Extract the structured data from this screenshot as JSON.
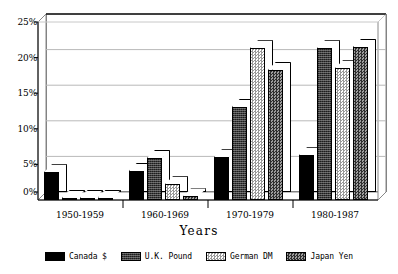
{
  "chart_data": {
    "type": "bar",
    "title": "",
    "xlabel": "Years",
    "ylabel": "",
    "categories": [
      "1950-1959",
      "1960-1969",
      "1970-1979",
      "1980-1987"
    ],
    "ylim": [
      0,
      25
    ],
    "ytick_values": [
      0,
      5,
      10,
      15,
      20,
      25
    ],
    "ytick_labels": [
      "0%",
      "5%",
      "10%",
      "15%",
      "20%",
      "25%"
    ],
    "grid": true,
    "legend_position": "bottom",
    "style": "3d-bar",
    "series": [
      {
        "name": "Canada $",
        "pattern": "solid-dark",
        "color": "#000000",
        "values": [
          3.9,
          4.1,
          6.0,
          6.3
        ]
      },
      {
        "name": "U.K. Pound",
        "pattern": "dark-texture",
        "color": "#3b3b3b",
        "values": [
          0.3,
          5.9,
          13.1,
          21.3
        ]
      },
      {
        "name": "German DM",
        "pattern": "light-check",
        "color": "#d8d8d8",
        "values": [
          0.3,
          2.2,
          21.3,
          18.5
        ]
      },
      {
        "name": "Japan Yen",
        "pattern": "mid-check",
        "color": "#6f6f6f",
        "values": [
          0.35,
          0.5,
          18.3,
          21.5
        ]
      }
    ]
  },
  "axis": {
    "x_title": "Years"
  },
  "legend": {
    "items": [
      {
        "label": "Canada $"
      },
      {
        "label": "U.K. Pound"
      },
      {
        "label": "German DM"
      },
      {
        "label": "Japan Yen"
      }
    ]
  }
}
